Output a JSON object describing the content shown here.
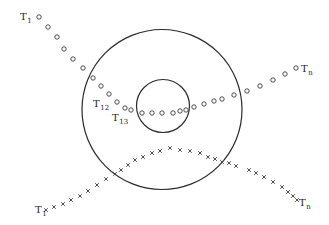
{
  "diagram": {
    "colors": {
      "stroke": "#2a2a2a",
      "marker": "#3a3a3a",
      "background": "#ffffff"
    },
    "circles": [
      {
        "name": "outer-circle",
        "cx": 162,
        "cy": 109.5,
        "r": 80
      },
      {
        "name": "inner-circle",
        "cx": 163,
        "cy": 106,
        "r": 26.5
      }
    ],
    "track_circles": {
      "marker": "circle",
      "points": [
        [
          39,
          17
        ],
        [
          48,
          27
        ],
        [
          57,
          37
        ],
        [
          64,
          49
        ],
        [
          73,
          59
        ],
        [
          83,
          68
        ],
        [
          93,
          78
        ],
        [
          101,
          86
        ],
        [
          109,
          94
        ],
        [
          117,
          102
        ],
        [
          125,
          108
        ],
        [
          131,
          110
        ],
        [
          142,
          113
        ],
        [
          152,
          113
        ],
        [
          162,
          113
        ],
        [
          173,
          113
        ],
        [
          180,
          111
        ],
        [
          186,
          110
        ],
        [
          194,
          107
        ],
        [
          204,
          104
        ],
        [
          214,
          101
        ],
        [
          222,
          99
        ],
        [
          234,
          95
        ],
        [
          247,
          91
        ],
        [
          260,
          86
        ],
        [
          273,
          80
        ],
        [
          285,
          74
        ],
        [
          296,
          68
        ]
      ],
      "labels": [
        {
          "id": "t1-top",
          "main": "T",
          "sub": "1",
          "x": 20,
          "y": 20
        },
        {
          "id": "t12",
          "main": "T",
          "sub": "12",
          "x": 93,
          "y": 107
        },
        {
          "id": "t13",
          "main": "T",
          "sub": "13",
          "x": 112,
          "y": 121
        },
        {
          "id": "tn-top",
          "main": "T",
          "sub": "n",
          "x": 301,
          "y": 72
        }
      ]
    },
    "track_crosses": {
      "marker": "cross",
      "points": [
        [
          46,
          210
        ],
        [
          54,
          207
        ],
        [
          63,
          204
        ],
        [
          71,
          200
        ],
        [
          80,
          196
        ],
        [
          88,
          191
        ],
        [
          97,
          185
        ],
        [
          106,
          179
        ],
        [
          115,
          174
        ],
        [
          121,
          170
        ],
        [
          128,
          165
        ],
        [
          135,
          160
        ],
        [
          143,
          157
        ],
        [
          152,
          153
        ],
        [
          160,
          151
        ],
        [
          170,
          148
        ],
        [
          180,
          150
        ],
        [
          190,
          151
        ],
        [
          200,
          153
        ],
        [
          208,
          157
        ],
        [
          215,
          159
        ],
        [
          222,
          162
        ],
        [
          229,
          163
        ],
        [
          236,
          166
        ],
        [
          249,
          170
        ],
        [
          256,
          173
        ],
        [
          264,
          177
        ],
        [
          273,
          182
        ],
        [
          282,
          187
        ],
        [
          288,
          192
        ],
        [
          293,
          196
        ],
        [
          297,
          200
        ]
      ],
      "labels": [
        {
          "id": "t1-bottom",
          "main": "T",
          "sub": "1",
          "x": 35,
          "y": 213
        },
        {
          "id": "tn-bottom",
          "main": "T",
          "sub": "n",
          "x": 299,
          "y": 206
        }
      ]
    }
  }
}
